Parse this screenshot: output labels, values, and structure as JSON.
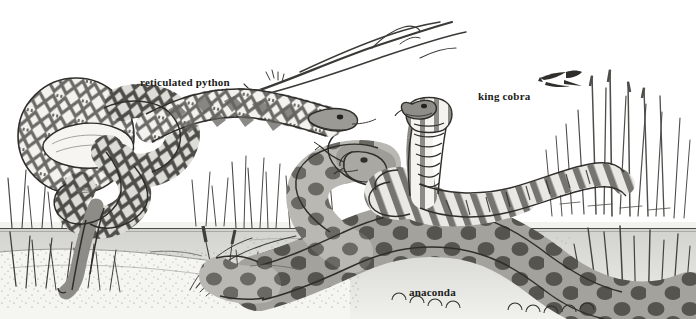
{
  "illustration": {
    "title": "Comparative illustration of three large snake species in a wetland riverbank scene",
    "style": "pen-and-ink stippled line drawing, grayscale",
    "background_color": "#ffffff",
    "ink_color": "#2b2b2b",
    "water_color": "#d8d8d4",
    "ground_color": "#ededea",
    "canvas": {
      "width": 696,
      "height": 319
    }
  },
  "labels": {
    "python": "reticulated python",
    "cobra": "king cobra",
    "anaconda": "anaconda"
  },
  "subjects": [
    {
      "name": "reticulated python",
      "label": "reticulated python",
      "position": "left",
      "pattern": "reticulated net-like diamond blotches",
      "pose": "coiled on riverbank with head extending right, tail hanging into water"
    },
    {
      "name": "king cobra",
      "label": "king cobra",
      "position": "center-right",
      "pattern": "pale chevron bands on hood and throat, dark crossbands on body",
      "pose": "hood raised upright, body coiled behind"
    },
    {
      "name": "anaconda",
      "label": "anaconda",
      "position": "foreground bottom",
      "pattern": "large dark round blotches",
      "pose": "thick body sprawling across foreground, head turned left with forked tongue"
    }
  ],
  "scenery": [
    {
      "element": "bare-branch",
      "position": "top-center-right"
    },
    {
      "element": "dragonfly",
      "position": "upper-right"
    },
    {
      "element": "reeds-tall",
      "position": "right"
    },
    {
      "element": "grass-clumps",
      "position": "left and center"
    },
    {
      "element": "waterline",
      "position": "horizontal across image at mid-lower height"
    },
    {
      "element": "stippled-sandbank",
      "position": "lower-left foreground"
    }
  ]
}
